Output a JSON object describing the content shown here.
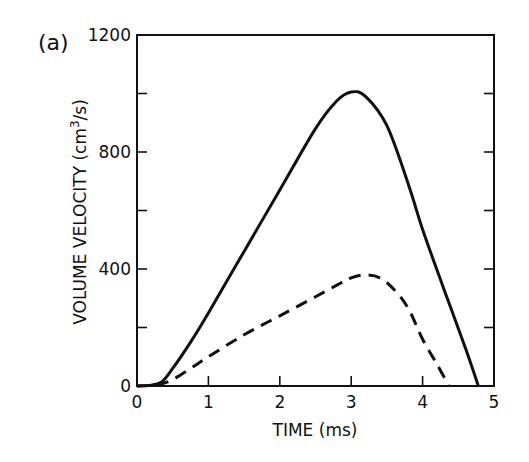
{
  "chart_data": {
    "type": "line",
    "panel_label": "(a)",
    "title": "",
    "xlabel": "TIME (ms)",
    "ylabel": "VOLUME VELOCITY (cm",
    "ylabel_sup": "3",
    "ylabel_tail": "/s)",
    "xlim": [
      0,
      5
    ],
    "ylim": [
      0,
      1200
    ],
    "x_ticks": [
      0,
      1,
      2,
      3,
      4,
      5
    ],
    "x_tick_labels": [
      "0",
      "1",
      "2",
      "3",
      "4",
      "5"
    ],
    "y_ticks": [
      0,
      200,
      400,
      600,
      800,
      1000,
      1200
    ],
    "y_tick_labels": [
      "0",
      "",
      "400",
      "",
      "800",
      "",
      "1200"
    ],
    "grid": false,
    "legend": null,
    "series": [
      {
        "name": "solid",
        "style": "solid",
        "x": [
          0,
          0.2,
          0.35,
          0.5,
          0.75,
          1.0,
          1.5,
          2.0,
          2.5,
          2.8,
          3.0,
          3.2,
          3.5,
          3.8,
          4.0,
          4.3,
          4.6,
          4.78
        ],
        "y": [
          0,
          3,
          15,
          60,
          150,
          250,
          460,
          670,
          880,
          975,
          1005,
          990,
          890,
          690,
          535,
          330,
          130,
          0
        ]
      },
      {
        "name": "dashed",
        "style": "dashed",
        "x": [
          0,
          0.3,
          0.5,
          0.75,
          1.0,
          1.5,
          2.0,
          2.5,
          2.8,
          3.0,
          3.2,
          3.4,
          3.6,
          3.8,
          4.0,
          4.2,
          4.37
        ],
        "y": [
          0,
          5,
          22,
          60,
          100,
          175,
          240,
          305,
          345,
          370,
          380,
          370,
          330,
          265,
          160,
          75,
          0
        ]
      }
    ]
  }
}
